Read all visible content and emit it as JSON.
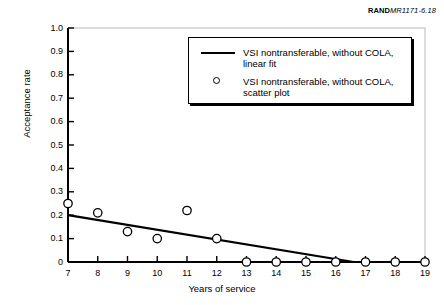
{
  "figure": {
    "source_tag_brand": "RAND",
    "source_tag_code": "MR1171-6.18"
  },
  "legend": {
    "entries": [
      {
        "label": "VSI nontransferable, without COLA, linear fit",
        "marker": "line-swatch"
      },
      {
        "label": "VSI nontransferable, without COLA, scatter plot",
        "marker": "circle-swatch"
      }
    ]
  },
  "chart_data": {
    "type": "scatter",
    "title": "",
    "xlabel": "Years of service",
    "ylabel": "Acceptance rate",
    "xlim": [
      7,
      19
    ],
    "ylim": [
      0,
      1.0
    ],
    "xticks": [
      7,
      8,
      9,
      10,
      11,
      12,
      13,
      14,
      15,
      16,
      17,
      18,
      19
    ],
    "xtick_labels": [
      "7",
      "8",
      "9",
      "10",
      "11",
      "12",
      "13",
      "14",
      "15",
      "16",
      "17",
      "18",
      "19"
    ],
    "yticks": [
      0,
      0.1,
      0.2,
      0.3,
      0.4,
      0.5,
      0.6,
      0.7,
      0.8,
      0.9,
      1.0
    ],
    "ytick_labels": [
      "0",
      "0.1",
      "0.2",
      "0.3",
      "0.4",
      "0.5",
      "0.6",
      "0.7",
      "0.8",
      "0.9",
      "1.0"
    ],
    "grid": false,
    "legend_position": "upper-center",
    "series": [
      {
        "name": "VSI nontransferable, without COLA, scatter plot",
        "type": "scatter",
        "marker": "open-circle",
        "color": "#000000",
        "x": [
          7,
          8,
          9,
          10,
          11,
          12,
          13,
          14,
          15,
          16,
          17,
          18,
          19
        ],
        "values": [
          0.25,
          0.21,
          0.13,
          0.1,
          0.22,
          0.1,
          0.0,
          0.0,
          0.0,
          0.0,
          0.0,
          0.0,
          0.0
        ]
      },
      {
        "name": "VSI nontransferable, without COLA, linear fit",
        "type": "line",
        "color": "#000000",
        "x": [
          7,
          16.6,
          19
        ],
        "values": [
          0.2,
          0.0,
          0.0
        ]
      }
    ]
  }
}
